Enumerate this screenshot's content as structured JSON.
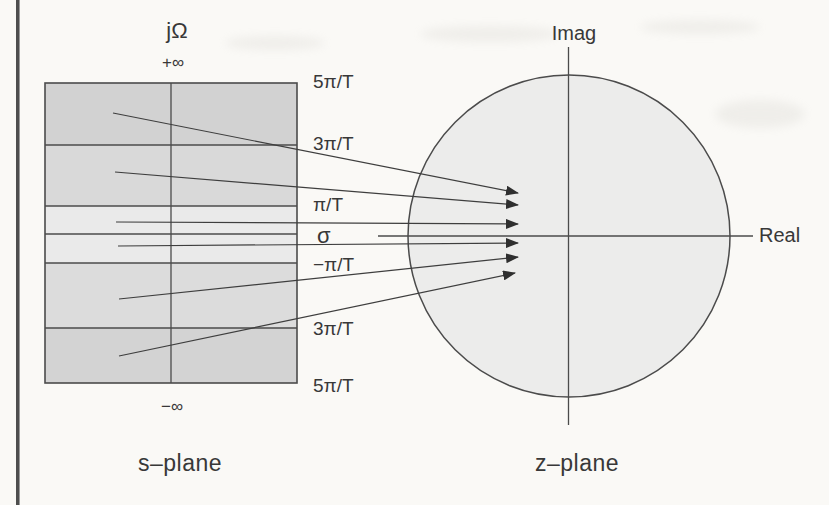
{
  "figure": {
    "caption_left": "s–plane",
    "caption_right": "z–plane"
  },
  "splane": {
    "axis_label": "jΩ",
    "pos_infinity": "+∞",
    "neg_infinity": "−∞",
    "freq_labels": [
      {
        "text": "5π/T",
        "y": 83
      },
      {
        "text": "3π/T",
        "y": 145
      },
      {
        "text": "π/T",
        "y": 206
      },
      {
        "text": "σ",
        "y": 238
      },
      {
        "text": "−π/T",
        "y": 266
      },
      {
        "text": "3π/T",
        "y": 330
      },
      {
        "text": "5π/T",
        "y": 387
      }
    ]
  },
  "zplane": {
    "imag_label": "Imag",
    "real_label": "Real"
  },
  "colors": {
    "paper": "#faf9f6",
    "ink": "#383838",
    "line": "#4b4b4b",
    "circle_fill": "#ececeb",
    "strip_dark": "#d2d2d2",
    "strip_mid": "#dcdcdc",
    "strip_light": "#eaeaea"
  },
  "diagram": {
    "strips": [
      {
        "y0": 83,
        "y1": 145,
        "fill": "#d2d2d2"
      },
      {
        "y0": 145,
        "y1": 206,
        "fill": "#d9d9d9"
      },
      {
        "y0": 206,
        "y1": 234,
        "fill": "#eaeaea"
      },
      {
        "y0": 234,
        "y1": 263,
        "fill": "#eaeaea"
      },
      {
        "y0": 263,
        "y1": 328,
        "fill": "#dcdcdc"
      },
      {
        "y0": 328,
        "y1": 383,
        "fill": "#d3d3d3"
      }
    ],
    "arrows": [
      {
        "x1": 113,
        "y1": 113,
        "x2": 518,
        "y2": 193
      },
      {
        "x1": 115,
        "y1": 172,
        "x2": 518,
        "y2": 205
      },
      {
        "x1": 116,
        "y1": 222,
        "x2": 518,
        "y2": 224
      },
      {
        "x1": 118,
        "y1": 246,
        "x2": 518,
        "y2": 243
      },
      {
        "x1": 119,
        "y1": 299,
        "x2": 518,
        "y2": 257
      },
      {
        "x1": 119,
        "y1": 356,
        "x2": 515,
        "y2": 273
      }
    ]
  }
}
